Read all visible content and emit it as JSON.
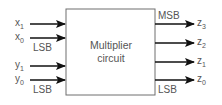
{
  "diagram": {
    "block": {
      "line1": "Multiplier",
      "line2": "circuit"
    },
    "inputs": [
      {
        "base": "x",
        "sub": "1"
      },
      {
        "base": "x",
        "sub": "0"
      },
      {
        "base": "y",
        "sub": "1"
      },
      {
        "base": "y",
        "sub": "0"
      }
    ],
    "input_annotations": {
      "x_lsb": "LSB",
      "y_lsb": "LSB"
    },
    "outputs": [
      {
        "base": "z",
        "sub": "3"
      },
      {
        "base": "z",
        "sub": "2"
      },
      {
        "base": "z",
        "sub": "1"
      },
      {
        "base": "z",
        "sub": "0"
      }
    ],
    "output_annotations": {
      "msb": "MSB",
      "lsb": "LSB"
    },
    "colors": {
      "line": "#111111",
      "box": "#6e6e6e",
      "text": "#555555"
    }
  }
}
